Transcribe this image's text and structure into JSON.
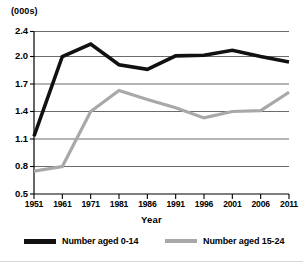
{
  "figure": {
    "unit_label": "(000s)",
    "xaxis_title": "Year",
    "background": "#ffffff"
  },
  "legend": {
    "entries": [
      {
        "label": "Number aged 0-14",
        "color": "#111111"
      },
      {
        "label": "Number aged 15-24",
        "color": "#a8a8a8"
      }
    ]
  },
  "chart_data": {
    "type": "line",
    "title": "",
    "subtitle": "",
    "xlabel": "Year",
    "ylabel": "(000s)",
    "grid": true,
    "legend_position": "bottom",
    "categories": [
      "1951",
      "1961",
      "1971",
      "1981",
      "1986",
      "1991",
      "1996",
      "2001",
      "2006",
      "2011"
    ],
    "ytick_labels": [
      "0.5",
      "0.8",
      "1.1",
      "1.4",
      "1.7",
      "2.0",
      "2.4"
    ],
    "ytick_values": [
      0.5,
      0.8,
      1.1,
      1.4,
      1.7,
      2.0,
      2.4
    ],
    "ylim": [
      0.5,
      2.4
    ],
    "series": [
      {
        "name": "Number aged 0-14",
        "color": "#111111",
        "values": [
          1.13,
          2.0,
          2.2,
          1.91,
          1.86,
          2.01,
          2.02,
          2.1,
          2.0,
          1.94
        ]
      },
      {
        "name": "Number aged 15-24",
        "color": "#a8a8a8",
        "values": [
          0.75,
          0.8,
          1.4,
          1.63,
          1.53,
          1.44,
          1.33,
          1.4,
          1.41,
          1.61
        ]
      }
    ]
  }
}
